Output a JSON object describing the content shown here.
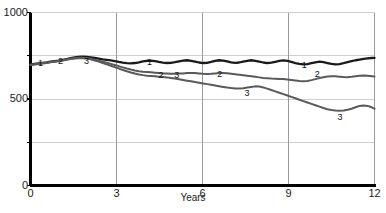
{
  "chart_data": {
    "type": "line",
    "title": "",
    "subtitle": "",
    "xlabel": "Years",
    "ylabel": "",
    "xlim": [
      0,
      12
    ],
    "ylim": [
      0,
      1000
    ],
    "xticks": [
      0,
      3,
      6,
      9,
      12
    ],
    "xticklabels": [
      "0",
      "3",
      "6",
      "9",
      "12"
    ],
    "yticks": [
      0,
      250,
      500,
      750,
      1000
    ],
    "yticklabels": [
      "0",
      "",
      "500",
      "",
      "1000"
    ],
    "grid": true,
    "grid_axes": "both",
    "legend": "inline-series-numbers",
    "series": [
      {
        "name": "1",
        "color": "#1a1a1a",
        "inline_labels": [
          {
            "text": "1",
            "x": 0.35,
            "y": 712
          },
          {
            "text": "1",
            "x": 4.15,
            "y": 718
          },
          {
            "text": "1",
            "x": 9.55,
            "y": 700
          }
        ],
        "x": [
          0.0,
          0.14,
          0.28,
          0.42,
          0.56,
          0.7,
          0.84,
          0.98,
          1.12,
          1.26,
          1.4,
          1.54,
          1.68,
          1.82,
          1.96,
          2.1,
          2.24,
          2.38,
          2.52,
          2.66,
          2.8,
          2.94,
          3.08,
          3.22,
          3.36,
          3.5,
          3.64,
          3.78,
          3.92,
          4.06,
          4.2,
          4.34,
          4.48,
          4.62,
          4.76,
          4.9,
          5.04,
          5.18,
          5.32,
          5.46,
          5.6,
          5.74,
          5.88,
          6.02,
          6.16,
          6.3,
          6.44,
          6.58,
          6.72,
          6.86,
          7.0,
          7.14,
          7.28,
          7.42,
          7.56,
          7.7,
          7.84,
          7.98,
          8.12,
          8.26,
          8.4,
          8.54,
          8.68,
          8.82,
          8.96,
          9.1,
          9.24,
          9.38,
          9.52,
          9.66,
          9.8,
          9.94,
          10.08,
          10.22,
          10.36,
          10.5,
          10.64,
          10.78,
          10.92,
          11.06,
          11.2,
          11.34,
          11.48,
          11.62,
          11.76,
          11.9,
          12.0
        ],
        "y": [
          700,
          703,
          706,
          709,
          712,
          716,
          719,
          722,
          726,
          731,
          736,
          740,
          743,
          745,
          744,
          741,
          737,
          733,
          729,
          726,
          723,
          719,
          714,
          710,
          707,
          706,
          708,
          712,
          717,
          721,
          722,
          719,
          714,
          710,
          708,
          709,
          713,
          718,
          722,
          724,
          721,
          716,
          711,
          708,
          709,
          714,
          720,
          724,
          722,
          717,
          712,
          709,
          711,
          716,
          721,
          724,
          721,
          716,
          711,
          708,
          710,
          715,
          720,
          723,
          720,
          714,
          708,
          703,
          700,
          702,
          707,
          712,
          716,
          713,
          708,
          703,
          700,
          702,
          707,
          713,
          719,
          724,
          728,
          732,
          735,
          737,
          738
        ]
      },
      {
        "name": "2",
        "color": "#5a5a5a",
        "inline_labels": [
          {
            "text": "2",
            "x": 1.05,
            "y": 722
          },
          {
            "text": "2",
            "x": 4.55,
            "y": 640
          },
          {
            "text": "2",
            "x": 6.6,
            "y": 648
          },
          {
            "text": "2",
            "x": 10.0,
            "y": 648
          }
        ],
        "x": [
          0.0,
          0.14,
          0.28,
          0.42,
          0.56,
          0.7,
          0.84,
          0.98,
          1.12,
          1.26,
          1.4,
          1.54,
          1.68,
          1.82,
          1.96,
          2.1,
          2.24,
          2.38,
          2.52,
          2.66,
          2.8,
          2.94,
          3.08,
          3.22,
          3.36,
          3.5,
          3.64,
          3.78,
          3.92,
          4.06,
          4.2,
          4.34,
          4.48,
          4.62,
          4.76,
          4.9,
          5.04,
          5.18,
          5.32,
          5.46,
          5.6,
          5.74,
          5.88,
          6.02,
          6.16,
          6.3,
          6.44,
          6.58,
          6.72,
          6.86,
          7.0,
          7.14,
          7.28,
          7.42,
          7.56,
          7.7,
          7.84,
          7.98,
          8.12,
          8.26,
          8.4,
          8.54,
          8.68,
          8.82,
          8.96,
          9.1,
          9.24,
          9.38,
          9.52,
          9.66,
          9.8,
          9.94,
          10.08,
          10.22,
          10.36,
          10.5,
          10.64,
          10.78,
          10.92,
          11.06,
          11.2,
          11.34,
          11.48,
          11.62,
          11.76,
          11.9,
          12.0
        ],
        "y": [
          698,
          701,
          704,
          707,
          710,
          714,
          717,
          720,
          724,
          729,
          733,
          736,
          738,
          739,
          736,
          732,
          727,
          721,
          715,
          709,
          703,
          697,
          690,
          683,
          676,
          670,
          665,
          661,
          658,
          656,
          654,
          652,
          650,
          648,
          647,
          646,
          646,
          647,
          648,
          650,
          651,
          650,
          648,
          646,
          645,
          646,
          648,
          650,
          651,
          649,
          646,
          643,
          640,
          637,
          634,
          631,
          628,
          625,
          622,
          620,
          618,
          617,
          616,
          615,
          613,
          610,
          607,
          604,
          602,
          604,
          609,
          615,
          621,
          626,
          630,
          632,
          631,
          629,
          627,
          626,
          628,
          631,
          634,
          636,
          635,
          632,
          630
        ]
      },
      {
        "name": "3",
        "color": "#5a5a5a",
        "inline_labels": [
          {
            "text": "3",
            "x": 1.95,
            "y": 722
          },
          {
            "text": "3",
            "x": 5.1,
            "y": 640
          },
          {
            "text": "3",
            "x": 7.55,
            "y": 540
          },
          {
            "text": "3",
            "x": 10.8,
            "y": 400
          }
        ],
        "x": [
          0.0,
          0.14,
          0.28,
          0.42,
          0.56,
          0.7,
          0.84,
          0.98,
          1.12,
          1.26,
          1.4,
          1.54,
          1.68,
          1.82,
          1.96,
          2.1,
          2.24,
          2.38,
          2.52,
          2.66,
          2.8,
          2.94,
          3.08,
          3.22,
          3.36,
          3.5,
          3.64,
          3.78,
          3.92,
          4.06,
          4.2,
          4.34,
          4.48,
          4.62,
          4.76,
          4.9,
          5.04,
          5.18,
          5.32,
          5.46,
          5.6,
          5.74,
          5.88,
          6.02,
          6.16,
          6.3,
          6.44,
          6.58,
          6.72,
          6.86,
          7.0,
          7.14,
          7.28,
          7.42,
          7.56,
          7.7,
          7.84,
          7.98,
          8.12,
          8.26,
          8.4,
          8.54,
          8.68,
          8.82,
          8.96,
          9.1,
          9.24,
          9.38,
          9.52,
          9.66,
          9.8,
          9.94,
          10.08,
          10.22,
          10.36,
          10.5,
          10.64,
          10.78,
          10.92,
          11.06,
          11.2,
          11.34,
          11.48,
          11.62,
          11.76,
          11.9,
          12.0
        ],
        "y": [
          696,
          699,
          702,
          705,
          708,
          712,
          715,
          718,
          722,
          727,
          731,
          734,
          736,
          737,
          734,
          729,
          723,
          716,
          708,
          700,
          692,
          684,
          676,
          668,
          660,
          653,
          647,
          642,
          638,
          635,
          633,
          631,
          629,
          627,
          625,
          622,
          618,
          614,
          610,
          606,
          602,
          598,
          594,
          590,
          586,
          582,
          578,
          574,
          570,
          566,
          563,
          561,
          560,
          562,
          566,
          570,
          573,
          572,
          567,
          560,
          552,
          544,
          536,
          528,
          520,
          512,
          504,
          496,
          488,
          480,
          472,
          464,
          456,
          448,
          441,
          436,
          433,
          432,
          434,
          438,
          444,
          452,
          460,
          463,
          460,
          452,
          444
        ]
      }
    ]
  },
  "axis": {
    "y_labels": [
      {
        "text": "1000",
        "value": 1000
      },
      {
        "text": "500",
        "value": 500
      },
      {
        "text": "0",
        "value": 0
      }
    ],
    "x_labels": [
      {
        "text": "0",
        "value": 0
      },
      {
        "text": "3",
        "value": 3
      },
      {
        "text": "6",
        "value": 6
      },
      {
        "text": "9",
        "value": 9
      },
      {
        "text": "12",
        "value": 12
      }
    ],
    "x_title": "Years"
  },
  "caption": {
    "text": "",
    "note": "partially cropped caption line at bottom edge"
  },
  "colors": {
    "series_1": "#1a1a1a",
    "series_2": "#5a5a5a",
    "series_3": "#5a5a5a",
    "grid": "#cfcfcf",
    "grid_vertical": "#9a9a9a",
    "axis": "#000000",
    "background": "#ffffff",
    "text": "#1a1a1a"
  }
}
